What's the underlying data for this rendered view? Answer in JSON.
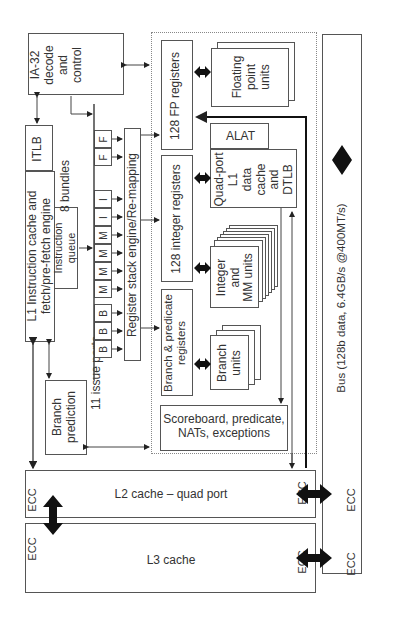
{
  "diagram": {
    "blocks": {
      "ia32": "IA-32\ndecode\nand\ncontrol",
      "itlb": "ITLB",
      "l1_icache": "L1 Instruction cache and\nfetch/pre-fetch engine",
      "instruction_queue": "Instruction\nqueue",
      "bundles": "8 bundles",
      "branch_prediction": "Branch\nprediction",
      "issue_ports_label": "11 issue ports",
      "register_stack": "Register stack engine/Re-mapping",
      "fp_registers": "128 FP registers",
      "fp_units": "Floating\npoint\nunits",
      "alat": "ALAT",
      "l1_dcache": "Quad-port\nL1\ndata\ncache\nand\nDTLB",
      "int_registers": "128 integer registers",
      "int_units": "Integer\nand\nMM units",
      "branch_pred_registers": "Branch & predicate\nregisters",
      "branch_units": "Branch\nunits",
      "scoreboard": "Scoreboard, predicate,\nNATs, exceptions",
      "l2_cache": "L2 cache – quad port",
      "l3_cache": "L3 cache",
      "bus": "Bus (128b data, 6.4GB/s @400MT/s)",
      "ecc": "ECC"
    },
    "issue_ports": [
      "B",
      "B",
      "B",
      "M",
      "M",
      "M",
      "M",
      "I",
      "I",
      "F",
      "F"
    ],
    "colors": {
      "line": "#555555",
      "text": "#333333",
      "arrow_fill": "#111111",
      "background": "#ffffff"
    }
  }
}
